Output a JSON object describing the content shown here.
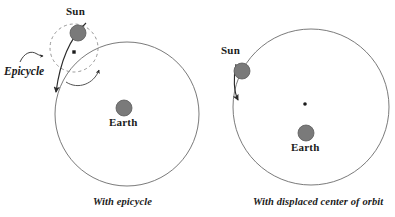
{
  "figure": {
    "background_color": "#ffffff",
    "orbit_stroke_color": "#6b6b6b",
    "epicycle_stroke_color": "#8a8a8a",
    "body_fill_color": "#7a7a7a",
    "body_stroke_color": "#5c5c5c",
    "arrow_color": "#2b2b2b",
    "text_color": "#1b1b1b"
  },
  "panels": [
    {
      "id": "with-epicycle",
      "caption": "With epicycle",
      "caption_x": 93,
      "caption_y": 198,
      "deferent": {
        "label": "deferent-orbit",
        "cx": 127,
        "cy": 114,
        "r": 72
      },
      "epicycle": {
        "label": "Epicycle",
        "label_x": 4,
        "label_y": 66,
        "cx": 74,
        "cy": 48,
        "r": 24,
        "dash": "3 3",
        "center_marker_cx": 74,
        "center_marker_cy": 52
      },
      "sun": {
        "label": "Sun",
        "label_x": 66,
        "label_y": 8,
        "cx": 78,
        "cy": 33,
        "r": 8
      },
      "earth": {
        "label": "Earth",
        "label_x": 109,
        "label_y": 122,
        "cx": 124,
        "cy": 108,
        "r": 8
      },
      "motion_arrow": {
        "name": "deferent-motion-arrow",
        "tip_x": 55,
        "tip_y": 99,
        "direction": "clockwise-downward"
      },
      "epicycle_arrow": {
        "name": "epicycle-motion-arrow",
        "tip_x": 101,
        "tip_y": 67,
        "direction": "counterclockwise"
      },
      "pointer_arrow": {
        "name": "epicycle-label-pointer",
        "tip_x": 44,
        "tip_y": 56
      }
    },
    {
      "id": "with-displaced-center",
      "caption": "With displaced center of orbit",
      "caption_x": 255,
      "caption_y": 198,
      "orbit": {
        "label": "eccentric-orbit",
        "cx": 311,
        "cy": 107,
        "r": 78
      },
      "orbit_center": {
        "label": "displaced-orbit-center",
        "cx": 305,
        "cy": 104,
        "r": 1.8
      },
      "sun": {
        "label": "Sun",
        "label_x": 222,
        "label_y": 48,
        "cx": 242,
        "cy": 71,
        "r": 8
      },
      "earth": {
        "label": "Earth",
        "label_x": 291,
        "label_y": 147,
        "cx": 306,
        "cy": 133,
        "r": 8
      },
      "motion_arrow": {
        "name": "orbit-motion-arrow",
        "tip_x": 239,
        "tip_y": 106,
        "direction": "clockwise-downward"
      }
    }
  ]
}
